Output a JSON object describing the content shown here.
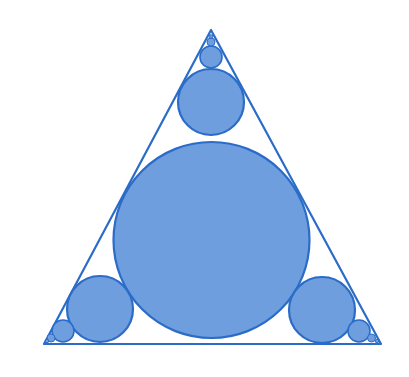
{
  "diagram": {
    "colors": {
      "fill": "#6e9ede",
      "stroke": "#2a6cc8",
      "background": "#ffffff"
    },
    "triangle": {
      "points": [
        [
          211,
          30
        ],
        [
          44,
          344
        ],
        [
          381,
          344
        ]
      ]
    },
    "circles": [
      {
        "name": "central-circle",
        "cx": 211.5,
        "cy": 240,
        "r": 98
      },
      {
        "name": "top-circle-1",
        "cx": 211,
        "cy": 102,
        "r": 33
      },
      {
        "name": "top-circle-2",
        "cx": 211,
        "cy": 57,
        "r": 11
      },
      {
        "name": "top-circle-3",
        "cx": 211,
        "cy": 42,
        "r": 4
      },
      {
        "name": "top-circle-4",
        "cx": 211,
        "cy": 36.5,
        "r": 1.8
      },
      {
        "name": "left-circle-1",
        "cx": 100,
        "cy": 309,
        "r": 33
      },
      {
        "name": "left-circle-2",
        "cx": 63,
        "cy": 331,
        "r": 11
      },
      {
        "name": "left-circle-3",
        "cx": 51,
        "cy": 338,
        "r": 4
      },
      {
        "name": "left-circle-4",
        "cx": 47,
        "cy": 341,
        "r": 1.8
      },
      {
        "name": "right-circle-1",
        "cx": 322,
        "cy": 310,
        "r": 33
      },
      {
        "name": "right-circle-2",
        "cx": 359,
        "cy": 331,
        "r": 11
      },
      {
        "name": "right-circle-3",
        "cx": 371.5,
        "cy": 338,
        "r": 4
      },
      {
        "name": "right-circle-4",
        "cx": 377,
        "cy": 341,
        "r": 1.8
      }
    ]
  }
}
